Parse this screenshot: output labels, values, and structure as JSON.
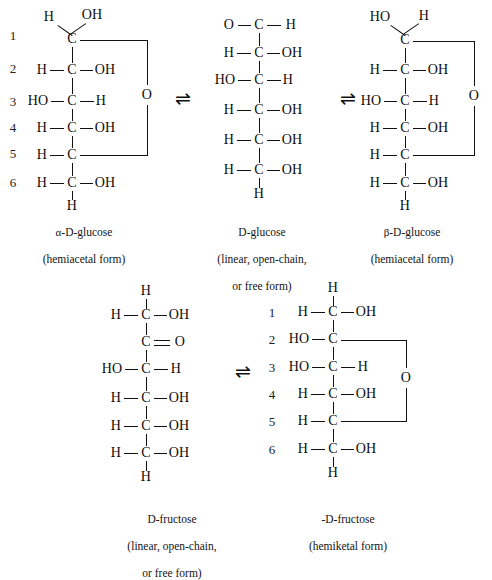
{
  "figure": {
    "background": "#ffffff",
    "ink": "#101010"
  },
  "equilibrium_symbol": "⇌",
  "numbering": [
    "1",
    "2",
    "3",
    "4",
    "5",
    "6"
  ],
  "structures": {
    "alpha_glucose": {
      "id": "alpha-d-glucose",
      "caption_line1_greek": "α",
      "caption_line1_rest": "-D-glucose",
      "caption_line2": "(hemiacetal form)",
      "show_numbers": true,
      "top_left_label": "H",
      "top_right_label": "OH",
      "bottom_label": "H",
      "ring_oxygen": "O",
      "carbons": [
        {
          "index": "1",
          "center": "C",
          "left": "",
          "right": "",
          "ring_open": true
        },
        {
          "index": "2",
          "center": "C",
          "left": "H",
          "right": "OH"
        },
        {
          "index": "3",
          "center": "C",
          "left": "HO",
          "right": "H"
        },
        {
          "index": "4",
          "center": "C",
          "left": "H",
          "right": "OH"
        },
        {
          "index": "5",
          "center": "C",
          "left": "H",
          "right": "",
          "ring_close": true
        },
        {
          "index": "6",
          "center": "C",
          "left": "H",
          "right": "OH"
        }
      ]
    },
    "linear_glucose": {
      "id": "d-glucose-linear",
      "caption_line1_rest": "D-glucose",
      "caption_line2": "(linear, open-chain,",
      "caption_line3": "or free form)",
      "show_numbers": false,
      "aldehyde_left": "O",
      "aldehyde_center": "C",
      "aldehyde_right": "H",
      "bottom_label": "H",
      "carbons": [
        {
          "index": "1",
          "center": "C",
          "left": "O",
          "right": "H",
          "carbonyl": true
        },
        {
          "index": "2",
          "center": "C",
          "left": "H",
          "right": "OH"
        },
        {
          "index": "3",
          "center": "C",
          "left": "HO",
          "right": "H"
        },
        {
          "index": "4",
          "center": "C",
          "left": "H",
          "right": "OH"
        },
        {
          "index": "5",
          "center": "C",
          "left": "H",
          "right": "OH"
        },
        {
          "index": "6",
          "center": "C",
          "left": "H",
          "right": "OH"
        }
      ]
    },
    "beta_glucose": {
      "id": "beta-d-glucose",
      "caption_line1_greek": "β",
      "caption_line1_rest": "-D-glucose",
      "caption_line2": "(hemiacetal form)",
      "show_numbers": false,
      "top_left_label": "HO",
      "top_right_label": "H",
      "bottom_label": "H",
      "ring_oxygen": "O",
      "carbons": [
        {
          "index": "1",
          "center": "C",
          "left": "",
          "right": "",
          "ring_open": true
        },
        {
          "index": "2",
          "center": "C",
          "left": "H",
          "right": "OH"
        },
        {
          "index": "3",
          "center": "C",
          "left": "HO",
          "right": "H"
        },
        {
          "index": "4",
          "center": "C",
          "left": "H",
          "right": "OH"
        },
        {
          "index": "5",
          "center": "C",
          "left": "H",
          "right": "",
          "ring_close": true
        },
        {
          "index": "6",
          "center": "C",
          "left": "H",
          "right": "OH"
        }
      ]
    },
    "linear_fructose": {
      "id": "d-fructose-linear",
      "caption_line1_rest": "D-fructose",
      "caption_line2": "(linear, open-chain,",
      "caption_line3": "or free form)",
      "show_numbers": false,
      "top_label": "H",
      "bottom_label": "H",
      "ketone_oxygen": "O",
      "carbons": [
        {
          "index": "1",
          "center": "C",
          "left": "H",
          "right": "OH"
        },
        {
          "index": "2",
          "center": "C",
          "left": "",
          "right": "O",
          "ketone": true
        },
        {
          "index": "3",
          "center": "C",
          "left": "HO",
          "right": "H"
        },
        {
          "index": "4",
          "center": "C",
          "left": "H",
          "right": "OH"
        },
        {
          "index": "5",
          "center": "C",
          "left": "H",
          "right": "OH"
        },
        {
          "index": "6",
          "center": "C",
          "left": "H",
          "right": "OH"
        }
      ]
    },
    "cyclic_fructose": {
      "id": "d-fructose-hemiketal",
      "caption_line1_greek": "",
      "caption_line1_rest": "-D-fructose",
      "caption_line2": "(hemiketal form)",
      "show_numbers": true,
      "top_label": "H",
      "bottom_label": "H",
      "ring_oxygen": "O",
      "carbons": [
        {
          "index": "1",
          "center": "C",
          "left": "H",
          "right": "OH"
        },
        {
          "index": "2",
          "center": "C",
          "left": "HO",
          "right": "",
          "ring_open": true
        },
        {
          "index": "3",
          "center": "C",
          "left": "HO",
          "right": "H"
        },
        {
          "index": "4",
          "center": "C",
          "left": "H",
          "right": "OH"
        },
        {
          "index": "5",
          "center": "C",
          "left": "H",
          "right": "",
          "ring_close": true
        },
        {
          "index": "6",
          "center": "C",
          "left": "H",
          "right": "OH"
        }
      ]
    }
  }
}
